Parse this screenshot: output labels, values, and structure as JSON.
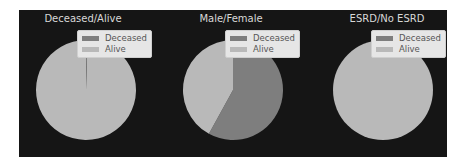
{
  "colors": {
    "background": "#151515",
    "deceased": "#7e7e7e",
    "alive": "#b9b9b9",
    "title": "#d8d8d8"
  },
  "legend": {
    "items": [
      {
        "label": "Deceased",
        "color": "#7e7e7e"
      },
      {
        "label": "Alive",
        "color": "#b9b9b9"
      }
    ]
  },
  "chart_data": [
    {
      "type": "pie",
      "title": "Deceased/Alive",
      "labels": [
        "Deceased",
        "Alive"
      ],
      "values": [
        0.5,
        99.5
      ],
      "startangle": 90,
      "legend_position": "upper right"
    },
    {
      "type": "pie",
      "title": "Male/Female",
      "labels": [
        "Deceased",
        "Alive"
      ],
      "values": [
        58,
        42
      ],
      "startangle": 90,
      "legend_position": "upper right"
    },
    {
      "type": "pie",
      "title": "ESRD/No ESRD",
      "labels": [
        "Deceased",
        "Alive"
      ],
      "values": [
        0,
        100
      ],
      "startangle": 90,
      "legend_position": "upper right"
    }
  ]
}
